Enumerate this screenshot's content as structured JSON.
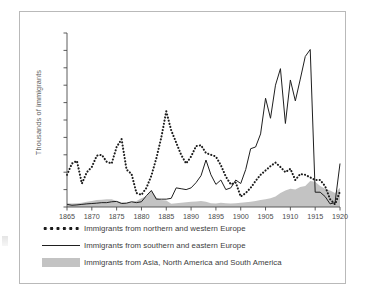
{
  "chart_data": {
    "type": "line",
    "title": "",
    "xlabel": "",
    "ylabel": "Thousands of immigrants",
    "xlim": [
      1865,
      1920
    ],
    "ylim": [
      0,
      1000
    ],
    "grid": false,
    "legend_position": "below",
    "xticks": [
      1865,
      1870,
      1875,
      1880,
      1885,
      1890,
      1895,
      1900,
      1905,
      1910,
      1915,
      1920
    ],
    "xtick_labels": [
      "1865",
      "1870",
      "1875",
      "1880",
      "1885",
      "1890",
      "1895",
      "1900",
      "1905",
      "1910",
      "1915",
      "1920"
    ],
    "yticks": [
      0,
      100,
      200,
      300,
      400,
      500,
      600,
      700,
      800,
      900,
      1000
    ],
    "ytick_labels": [
      "0",
      "100",
      "200",
      "300",
      "400",
      "500",
      "600",
      "700",
      "800",
      "900",
      "1,000"
    ],
    "x": [
      1865,
      1866,
      1867,
      1868,
      1869,
      1870,
      1871,
      1872,
      1873,
      1874,
      1875,
      1876,
      1877,
      1878,
      1879,
      1880,
      1881,
      1882,
      1883,
      1884,
      1885,
      1886,
      1887,
      1888,
      1889,
      1890,
      1891,
      1892,
      1893,
      1894,
      1895,
      1896,
      1897,
      1898,
      1899,
      1900,
      1901,
      1902,
      1903,
      1904,
      1905,
      1906,
      1907,
      1908,
      1909,
      1910,
      1911,
      1912,
      1913,
      1914,
      1915,
      1916,
      1917,
      1918,
      1919,
      1920
    ],
    "series": [
      {
        "name": "Immigrants from northern and western Europe",
        "style": "dotted",
        "color": "#1c1c1c",
        "values": [
          185,
          250,
          265,
          135,
          200,
          230,
          295,
          300,
          260,
          250,
          345,
          390,
          215,
          190,
          80,
          70,
          110,
          180,
          280,
          400,
          550,
          440,
          370,
          300,
          250,
          290,
          350,
          355,
          310,
          300,
          290,
          240,
          175,
          130,
          140,
          60,
          80,
          110,
          150,
          185,
          210,
          235,
          255,
          230,
          200,
          220,
          155,
          190,
          185,
          170,
          155,
          155,
          120,
          45,
          15,
          90
        ]
      },
      {
        "name": "Immigrants from southern and eastern Europe",
        "style": "solid",
        "color": "#1f1f1f",
        "values": [
          15,
          10,
          12,
          15,
          18,
          20,
          22,
          25,
          25,
          30,
          32,
          20,
          22,
          30,
          25,
          30,
          65,
          95,
          45,
          45,
          45,
          50,
          110,
          105,
          100,
          110,
          140,
          180,
          270,
          185,
          130,
          155,
          100,
          110,
          155,
          135,
          215,
          335,
          345,
          420,
          625,
          510,
          700,
          795,
          480,
          730,
          610,
          735,
          865,
          905,
          85,
          85,
          60,
          18,
          25,
          250
        ]
      },
      {
        "name": "Immigrants from Asia, North America and South America",
        "style": "area",
        "color": "#c3c3c3",
        "values": [
          22,
          20,
          22,
          25,
          30,
          35,
          40,
          42,
          45,
          45,
          35,
          28,
          25,
          30,
          35,
          50,
          60,
          95,
          55,
          40,
          38,
          18,
          22,
          25,
          28,
          30,
          32,
          35,
          30,
          22,
          20,
          25,
          22,
          20,
          22,
          25,
          28,
          30,
          35,
          40,
          45,
          50,
          60,
          80,
          95,
          105,
          100,
          115,
          120,
          150,
          145,
          120,
          105,
          95,
          80,
          110
        ]
      }
    ]
  },
  "axis": {
    "ylabel": "Thousands of immigrants"
  },
  "legend": {
    "items": [
      {
        "key": "dotted",
        "label": "Immigrants from northern and western Europe"
      },
      {
        "key": "solid",
        "label": "Immigrants from southern and eastern Europe"
      },
      {
        "key": "area",
        "label": "Immigrants from Asia, North America and South America"
      }
    ]
  },
  "colors": {
    "frame": "#b9b9b9",
    "axis": "#4a4a4a",
    "line": "#1f1f1f",
    "dotted": "#1c1c1c",
    "area": "#c3c3c3",
    "text": "#3c3c3c"
  }
}
